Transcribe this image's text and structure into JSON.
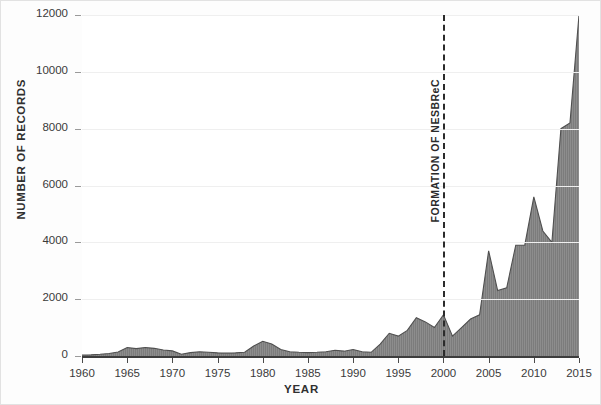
{
  "chart_data": {
    "type": "area",
    "title": "",
    "xlabel": "YEAR",
    "ylabel": "NUMBER OF RECORDS",
    "xlim": [
      1960,
      2015
    ],
    "ylim": [
      0,
      12000
    ],
    "xticks": [
      1960,
      1965,
      1970,
      1975,
      1980,
      1985,
      1990,
      1995,
      2000,
      2005,
      2010,
      2015
    ],
    "yticks": [
      0,
      2000,
      4000,
      6000,
      8000,
      10000,
      12000
    ],
    "grid": true,
    "legend": false,
    "series_name": "Number of records",
    "fill_color": "#7c7c7c",
    "line_color": "#555555",
    "x": [
      1960,
      1961,
      1962,
      1963,
      1964,
      1965,
      1966,
      1967,
      1968,
      1969,
      1970,
      1971,
      1972,
      1973,
      1974,
      1975,
      1976,
      1977,
      1978,
      1979,
      1980,
      1981,
      1982,
      1983,
      1984,
      1985,
      1986,
      1987,
      1988,
      1989,
      1990,
      1991,
      1992,
      1993,
      1994,
      1995,
      1996,
      1997,
      1998,
      1999,
      2000,
      2001,
      2002,
      2003,
      2004,
      2005,
      2006,
      2007,
      2008,
      2009,
      2010,
      2011,
      2012,
      2013,
      2014,
      2015
    ],
    "values": [
      30,
      40,
      60,
      90,
      140,
      300,
      260,
      300,
      270,
      210,
      180,
      60,
      120,
      150,
      130,
      110,
      100,
      110,
      130,
      350,
      520,
      420,
      230,
      150,
      130,
      120,
      130,
      150,
      200,
      170,
      230,
      150,
      130,
      420,
      800,
      700,
      900,
      1350,
      1200,
      1000,
      1450,
      700,
      1000,
      1300,
      1450,
      3700,
      2300,
      2400,
      3900,
      3900,
      5600,
      4400,
      4000,
      8000,
      8200,
      12000
    ],
    "annotations": [
      {
        "label": "FORMATION OF NESBReC",
        "x": 2000,
        "style": "dashed-vline"
      }
    ]
  },
  "axis": {
    "y_tick_labels": [
      "0",
      "2000",
      "4000",
      "6000",
      "8000",
      "10000",
      "12000"
    ],
    "x_tick_labels": [
      "1960",
      "1965",
      "1970",
      "1975",
      "1980",
      "1985",
      "1990",
      "1995",
      "2000",
      "2005",
      "2010",
      "2015"
    ]
  }
}
